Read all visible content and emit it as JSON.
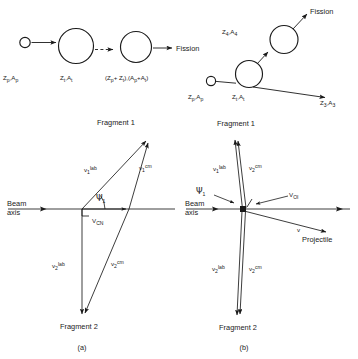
{
  "figure": {
    "title": "",
    "panels": [
      {
        "id": "panel-a",
        "caption": "(a)",
        "name": "velocity-vector-diagram-compound-nucleus"
      },
      {
        "id": "panel-b",
        "caption": "(b)",
        "name": "velocity-vector-diagram-transfer-induced-fission"
      }
    ]
  },
  "reaction_top_left": {
    "name": "complete-fusion-fission-scheme",
    "projectile_label": "Zₚ,Aₚ",
    "projectile_Z": "Z",
    "projectile_Zsub": "p",
    "projectile_A": "A",
    "projectile_Asub": "p",
    "target_label": "Zₜ,Aₜ",
    "target_Z": "Z",
    "target_Zsub": "t",
    "target_A": "A",
    "target_Asub": "t",
    "compound_open": "(",
    "compound_Z1": "Z",
    "compound_Z1sub": "p",
    "compound_plus": "+ ",
    "compound_Z2": "Z",
    "compound_Z2sub": "t",
    "compound_mid": "),(",
    "compound_A1": "A",
    "compound_A1sub": "p",
    "compound_A2": "A",
    "compound_A2sub": "t",
    "compound_close": ")",
    "fission_label": "Fission"
  },
  "reaction_top_right": {
    "name": "transfer-induced-fission-scheme",
    "projectile_label": "Zₚ,Aₚ",
    "projectile_Z": "Z",
    "projectile_Zsub": "p",
    "projectile_A": "A",
    "projectile_Asub": "p",
    "target_label": "Zₜ,Aₜ",
    "target_Z": "Z",
    "target_Zsub": "t",
    "target_A": "A",
    "target_Asub": "t",
    "fissioning_Z": "Z",
    "fissioning_Zsub": "4",
    "fissioning_A": "A",
    "fissioning_Asub": "4",
    "ejectile_Z": "Z",
    "ejectile_Zsub": "3",
    "ejectile_A": "A",
    "ejectile_Asub": "3",
    "fission_label": "Fission"
  },
  "panel_a": {
    "caption": "(a)",
    "beam_axis_line1": "Beam",
    "beam_axis_line2": "axis",
    "fragment1_label": "Fragment 1",
    "fragment2_label": "Fragment 2",
    "v1lab_base": "v",
    "v1lab_sub": "1",
    "v1lab_sup": "lab",
    "v1cm_base": "v",
    "v1cm_sub": "1",
    "v1cm_sup": "cm",
    "v2lab_base": "v",
    "v2lab_sub": "2",
    "v2lab_sup": "lab",
    "v2cm_base": "v",
    "v2cm_sub": "2",
    "v2cm_sup": "cm",
    "vcn_base": "V",
    "vcn_sub": "CN",
    "psi_symbol": "Ψ",
    "psi_sub": "1"
  },
  "panel_b": {
    "caption": "(b)",
    "beam_axis_line1": "Beam",
    "beam_axis_line2": "axis",
    "fragment1_label": "Fragment 1",
    "fragment2_label": "Fragment 2",
    "v1lab_base": "v",
    "v1lab_sub": "1",
    "v1lab_sup": "lab",
    "v1cm_base": "v",
    "v1cm_sub": "2",
    "v1cm_sup": "cm",
    "v2lab_base": "v",
    "v2lab_sub": "2",
    "v2lab_sup": "lab",
    "v2cm_base": "v",
    "v2cm_sub": "2",
    "v2cm_sup": "cm",
    "voi_base": "V",
    "voi_sub": "OI",
    "psi_symbol": "Ψ",
    "psi_sub": "1",
    "projectile_v": "v",
    "projectile_label": "Projectile"
  },
  "colors": {
    "ink": "#1a1a1a",
    "background": "#ffffff"
  }
}
